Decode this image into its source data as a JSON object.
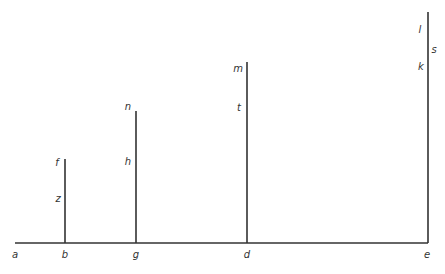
{
  "diagram": {
    "line_color": "#333333",
    "baseline": {
      "x1": 15,
      "x2": 428,
      "y": 243
    },
    "verticals": [
      {
        "id": "b",
        "x": 65,
        "top": 159,
        "bottom": 243
      },
      {
        "id": "g",
        "x": 136,
        "top": 111,
        "bottom": 243
      },
      {
        "id": "d",
        "x": 247,
        "top": 62,
        "bottom": 243
      },
      {
        "id": "e",
        "x": 428,
        "top": 12,
        "bottom": 243
      }
    ],
    "labels": [
      {
        "text": "a",
        "x": 15,
        "y": 255
      },
      {
        "text": "b",
        "x": 65,
        "y": 255
      },
      {
        "text": "g",
        "x": 136,
        "y": 255
      },
      {
        "text": "d",
        "x": 247,
        "y": 255
      },
      {
        "text": "e",
        "x": 427,
        "y": 255
      },
      {
        "text": "f",
        "x": 57,
        "y": 163
      },
      {
        "text": "z",
        "x": 58,
        "y": 199
      },
      {
        "text": "n",
        "x": 128,
        "y": 107
      },
      {
        "text": "h",
        "x": 128,
        "y": 162
      },
      {
        "text": "m",
        "x": 238,
        "y": 69
      },
      {
        "text": "t",
        "x": 239,
        "y": 108
      },
      {
        "text": "l",
        "x": 420,
        "y": 30
      },
      {
        "text": "s",
        "x": 434,
        "y": 50
      },
      {
        "text": "k",
        "x": 421,
        "y": 67
      }
    ]
  }
}
